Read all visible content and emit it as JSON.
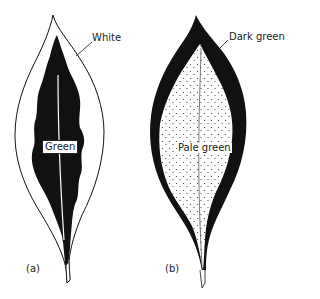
{
  "diagram": {
    "type": "leaf variegation illustration",
    "panels": [
      {
        "id": "a",
        "label": "(a)",
        "regions": [
          {
            "name": "margin",
            "label": "White",
            "fill": "#ffffff"
          },
          {
            "name": "center",
            "label": "Green",
            "fill": "#111111"
          }
        ]
      },
      {
        "id": "b",
        "label": "(b)",
        "regions": [
          {
            "name": "margin",
            "label": "Dark green",
            "fill": "#111111"
          },
          {
            "name": "center",
            "label": "Pale green",
            "fill": "#ffffff",
            "pattern": "stippled dots"
          }
        ]
      }
    ]
  },
  "labels": {
    "a_white": "White",
    "a_green": "Green",
    "a_caption": "(a)",
    "b_dark_green": "Dark green",
    "b_pale_green": "Pale green",
    "b_caption": "(b)"
  },
  "colors": {
    "ink": "#111111",
    "background": "#ffffff"
  }
}
